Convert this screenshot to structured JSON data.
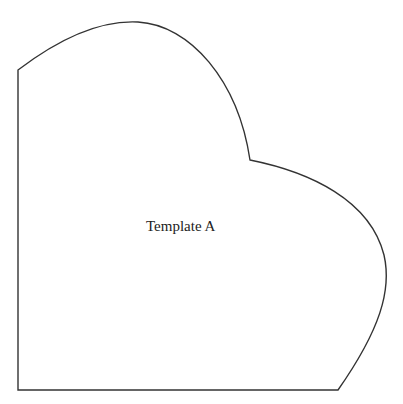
{
  "template": {
    "label": "Template A",
    "stroke_color": "#333333",
    "fill_color": "#ffffff"
  }
}
